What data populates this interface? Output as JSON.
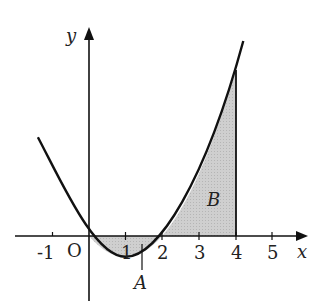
{
  "figure": {
    "function": "y = x^2 - 2x",
    "axes": {
      "x_label": "x",
      "y_label": "y",
      "origin_label": "O",
      "x_ticks": [
        "-1",
        "1",
        "2",
        "3",
        "4",
        "5"
      ]
    },
    "regions": [
      {
        "label": "A",
        "from": 0,
        "to": 2,
        "description": "region between curve and x-axis below axis"
      },
      {
        "label": "B",
        "from": 2,
        "to": 4,
        "description": "region between curve and x-axis above axis, bounded by x=4"
      }
    ],
    "colors": {
      "shade": "#c8c8c8",
      "stroke": "#111111"
    }
  }
}
